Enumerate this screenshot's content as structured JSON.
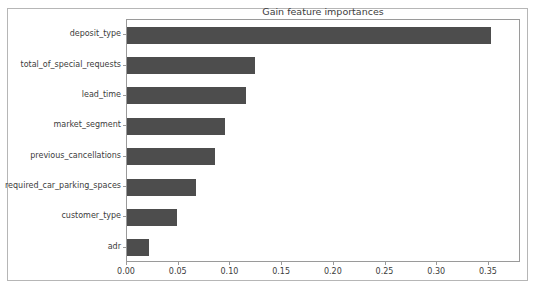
{
  "chart_data": {
    "type": "bar",
    "orientation": "horizontal",
    "title": "Gain feature importances",
    "xlabel": "",
    "ylabel": "",
    "categories": [
      "deposit_type",
      "total_of_special_requests",
      "lead_time",
      "market_segment",
      "previous_cancellations",
      "required_car_parking_spaces",
      "customer_type",
      "adr"
    ],
    "values": [
      0.352,
      0.124,
      0.115,
      0.095,
      0.085,
      0.067,
      0.048,
      0.021
    ],
    "xlim": [
      0.0,
      0.381
    ],
    "xticks": [
      0.0,
      0.05,
      0.1,
      0.15,
      0.2,
      0.25,
      0.3,
      0.35
    ],
    "xtick_labels": [
      "0.00",
      "0.05",
      "0.10",
      "0.15",
      "0.20",
      "0.25",
      "0.30",
      "0.35"
    ],
    "grid": false,
    "legend": null,
    "bar_color": "#4d4d4d",
    "background_color": "#ffffff",
    "axis_color": "#9a9a9a",
    "text_color": "#3c3c3c"
  }
}
